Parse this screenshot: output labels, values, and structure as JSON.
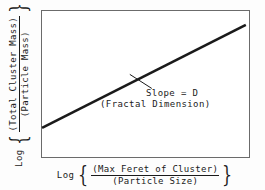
{
  "chart_data": {
    "type": "line",
    "title": "",
    "subtitle": "",
    "xlabel_text": "Log {(Max Feret of Cluster)/(Particle Size)}",
    "ylabel_text": "Log {(Total Cluster Mass)/(Particle Mass)}",
    "xlabel": {
      "log_word": "Log",
      "brace_open": "{",
      "numerator": "(Max Feret of Cluster)",
      "denominator": "(Particle Size)",
      "brace_close": "}"
    },
    "ylabel": {
      "log_word": "Log",
      "brace_open": "{",
      "numerator": "(Total Cluster Mass)",
      "denominator": "(Particle Mass)",
      "brace_close": "}"
    },
    "x": [
      0,
      1
    ],
    "y": [
      0,
      1
    ],
    "series": [
      {
        "name": "fractal scaling line",
        "x": [
          0.005,
          0.98
        ],
        "y": [
          0.203,
          0.899
        ],
        "color": "#1a1a1a",
        "width": 2.6
      }
    ],
    "xlim": [
      0,
      1
    ],
    "ylim": [
      0,
      1
    ],
    "grid": false,
    "ticks": false,
    "legend": "none",
    "annotations": [
      {
        "line1": "Slope = D",
        "line2": "(Fractal Dimension)",
        "leader_from": [
          0.425,
          0.565
        ],
        "leader_to": [
          0.53,
          0.47
        ]
      }
    ],
    "frame_color": "#6b6b6b",
    "background": "#ffffff"
  }
}
